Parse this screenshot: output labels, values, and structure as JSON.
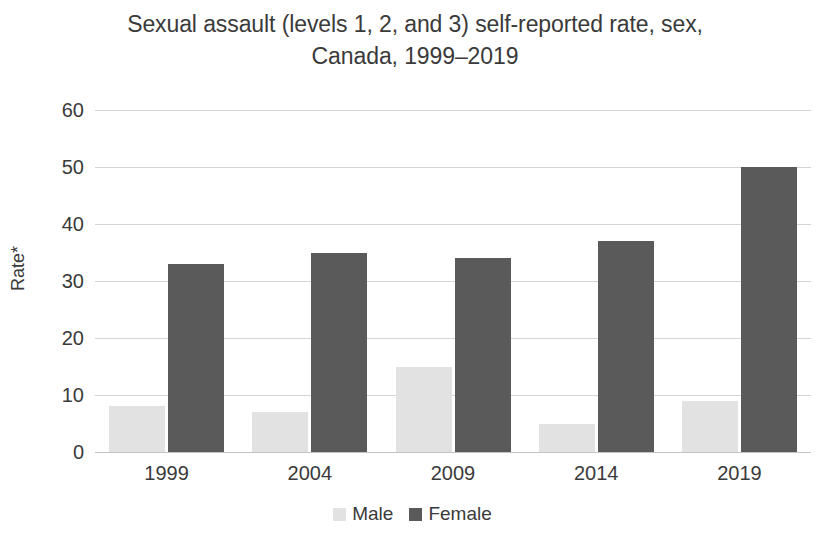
{
  "chart_data": {
    "type": "bar",
    "title": "Sexual assault (levels 1, 2, and 3) self-reported rate, sex,\nCanada, 1999–2019",
    "xlabel": "",
    "ylabel": "Rate*",
    "categories": [
      "1999",
      "2004",
      "2009",
      "2014",
      "2019"
    ],
    "series": [
      {
        "name": "Male",
        "color": "#e2e2e2",
        "values": [
          8,
          7,
          15,
          5,
          9
        ]
      },
      {
        "name": "Female",
        "color": "#5a5a5a",
        "values": [
          33,
          35,
          34,
          37,
          50
        ]
      }
    ],
    "ylim": [
      0,
      60
    ],
    "ytick_values": [
      60,
      50,
      40,
      30,
      20,
      10,
      0
    ],
    "ytick_labels": [
      "60",
      "50",
      "40",
      "30",
      "20",
      "10",
      "0"
    ],
    "grid": "horizontal",
    "legend_position": "bottom-center",
    "legend_entries": [
      "Male",
      "Female"
    ]
  }
}
